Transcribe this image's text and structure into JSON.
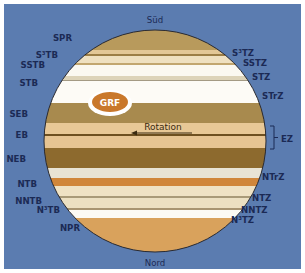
{
  "diagram": {
    "background_color": "#5b7cb0",
    "pole_labels": {
      "south": "Süd",
      "north": "Nord"
    },
    "left_labels": [
      {
        "id": "spr",
        "text": "SPR",
        "x": 72,
        "y": 41
      },
      {
        "id": "s3tb",
        "text": "S³TB",
        "x": 58,
        "y": 58
      },
      {
        "id": "sstb",
        "text": "SSTB",
        "x": 45,
        "y": 68
      },
      {
        "id": "stb",
        "text": "STB",
        "x": 38,
        "y": 86
      },
      {
        "id": "seb",
        "text": "SEB",
        "x": 28,
        "y": 117
      },
      {
        "id": "eb",
        "text": "EB",
        "x": 28,
        "y": 138
      },
      {
        "id": "neb",
        "text": "NEB",
        "x": 26,
        "y": 162
      },
      {
        "id": "ntb",
        "text": "NTB",
        "x": 37,
        "y": 187
      },
      {
        "id": "nntb",
        "text": "NNTB",
        "x": 42,
        "y": 204
      },
      {
        "id": "n3tb",
        "text": "N³TB",
        "x": 60,
        "y": 213
      },
      {
        "id": "npr",
        "text": "NPR",
        "x": 80,
        "y": 231
      }
    ],
    "right_labels": [
      {
        "id": "s3tz",
        "text": "S³TZ",
        "x": 232,
        "y": 56
      },
      {
        "id": "sstz",
        "text": "SSTZ",
        "x": 243,
        "y": 66
      },
      {
        "id": "stz",
        "text": "STZ",
        "x": 252,
        "y": 80
      },
      {
        "id": "strz",
        "text": "STrZ",
        "x": 262,
        "y": 99
      },
      {
        "id": "ez",
        "text": "EZ",
        "x": 281,
        "y": 142
      },
      {
        "id": "ntrz",
        "text": "NTrZ",
        "x": 262,
        "y": 180
      },
      {
        "id": "ntz",
        "text": "NTZ",
        "x": 252,
        "y": 201
      },
      {
        "id": "nntz",
        "text": "NNTZ",
        "x": 241,
        "y": 213
      },
      {
        "id": "n3tz",
        "text": "N³TZ",
        "x": 231,
        "y": 223
      }
    ],
    "bands": [
      {
        "name": "SPR",
        "y": 28,
        "h": 22,
        "color": "#b89a5c"
      },
      {
        "name": "S3TZ",
        "y": 50,
        "h": 4,
        "color": "#e3c796"
      },
      {
        "name": "S3TB",
        "y": 54,
        "h": 2,
        "color": "#9c7e46"
      },
      {
        "name": "SSTZ",
        "y": 56,
        "h": 7,
        "color": "#efe0c0"
      },
      {
        "name": "SSTB",
        "y": 63,
        "h": 2,
        "color": "#c2a66f"
      },
      {
        "name": "STZ",
        "y": 65,
        "h": 11,
        "color": "#fbf8f0"
      },
      {
        "name": "STB",
        "y": 76,
        "h": 4,
        "color": "#ddd3b8"
      },
      {
        "name": "STB-line",
        "y": 80,
        "h": 1,
        "color": "#a49a84"
      },
      {
        "name": "STrZ",
        "y": 81,
        "h": 22,
        "color": "#fdfbf6"
      },
      {
        "name": "SEB",
        "y": 103,
        "h": 20,
        "color": "#a88a4e"
      },
      {
        "name": "EZs",
        "y": 123,
        "h": 11,
        "color": "#e8c896"
      },
      {
        "name": "EB",
        "y": 134,
        "h": 2,
        "color": "#6e5020"
      },
      {
        "name": "EZn",
        "y": 136,
        "h": 12,
        "color": "#e6c492"
      },
      {
        "name": "NEB",
        "y": 148,
        "h": 20,
        "color": "#8d6a2e"
      },
      {
        "name": "NTrZ",
        "y": 168,
        "h": 10,
        "color": "#e8e3d4"
      },
      {
        "name": "NTB",
        "y": 178,
        "h": 8,
        "color": "#d0863a"
      },
      {
        "name": "NTZ",
        "y": 186,
        "h": 10,
        "color": "#efe2c4"
      },
      {
        "name": "NNTB",
        "y": 196,
        "h": 2,
        "color": "#a99a78"
      },
      {
        "name": "NNTZ",
        "y": 198,
        "h": 10,
        "color": "#ece0c2"
      },
      {
        "name": "N3TB",
        "y": 208,
        "h": 2,
        "color": "#a89572"
      },
      {
        "name": "N3TZ",
        "y": 210,
        "h": 8,
        "color": "#fcfaf4"
      },
      {
        "name": "NPR",
        "y": 218,
        "h": 36,
        "color": "#d9a25c"
      }
    ],
    "grf": {
      "label": "GRF",
      "color": "#c9782c"
    },
    "rotation": {
      "label": "Rotation"
    }
  }
}
